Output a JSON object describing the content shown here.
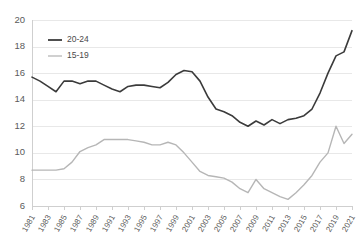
{
  "chart_data": {
    "type": "line",
    "title": "",
    "subtitle": "",
    "xlabel": "",
    "ylabel": "",
    "xlim": [
      1981,
      2021
    ],
    "ylim": [
      6,
      20
    ],
    "ytick_step": 2,
    "grid": true,
    "legend_position": "top-left",
    "ytick_labels": [
      "20",
      "18",
      "16",
      "14",
      "12",
      "10",
      "8",
      "6"
    ],
    "ytick_values": [
      20,
      18,
      16,
      14,
      12,
      10,
      8,
      6
    ],
    "xtick_labels": [
      "1981",
      "1983",
      "1985",
      "1987",
      "1989",
      "1991",
      "1993",
      "1995",
      "1997",
      "1999",
      "2001",
      "2003",
      "2005",
      "2007",
      "2009",
      "2011",
      "2013",
      "2015",
      "2017",
      "2019",
      "2021"
    ],
    "xtick_values": [
      1981,
      1983,
      1985,
      1987,
      1989,
      1991,
      1993,
      1995,
      1997,
      1999,
      2001,
      2003,
      2005,
      2007,
      2009,
      2011,
      2013,
      2015,
      2017,
      2019,
      2021
    ],
    "x": [
      1981,
      1982,
      1983,
      1984,
      1985,
      1986,
      1987,
      1988,
      1989,
      1990,
      1991,
      1992,
      1993,
      1994,
      1995,
      1996,
      1997,
      1998,
      1999,
      2000,
      2001,
      2002,
      2003,
      2004,
      2005,
      2006,
      2007,
      2008,
      2009,
      2010,
      2011,
      2012,
      2013,
      2014,
      2015,
      2016,
      2017,
      2018,
      2019,
      2020,
      2021
    ],
    "series": [
      {
        "name": "20-24",
        "color": "#3b3b3b",
        "width": 1.6,
        "values": [
          15.7,
          15.4,
          15.0,
          14.6,
          15.4,
          15.4,
          15.2,
          15.4,
          15.4,
          15.1,
          14.8,
          14.6,
          15.0,
          15.1,
          15.1,
          15.0,
          14.9,
          15.3,
          15.9,
          16.2,
          16.1,
          15.4,
          14.2,
          13.3,
          13.1,
          12.8,
          12.3,
          12.0,
          12.4,
          12.1,
          12.5,
          12.2,
          12.5,
          12.6,
          12.8,
          13.3,
          14.5,
          16.0,
          17.3,
          17.6,
          19.2
        ]
      },
      {
        "name": "15-19",
        "color": "#b6b6b6",
        "width": 1.4,
        "values": [
          8.7,
          8.7,
          8.7,
          8.7,
          8.8,
          9.3,
          10.1,
          10.4,
          10.6,
          11.0,
          11.0,
          11.0,
          11.0,
          10.9,
          10.8,
          10.6,
          10.6,
          10.8,
          10.6,
          10.0,
          9.3,
          8.6,
          8.3,
          8.2,
          8.1,
          7.8,
          7.3,
          7.0,
          8.0,
          7.3,
          7.0,
          6.7,
          6.5,
          7.0,
          7.6,
          8.3,
          9.3,
          10.0,
          12.0,
          10.7,
          11.4
        ]
      }
    ]
  },
  "legend": {
    "items": [
      {
        "label": "20-24",
        "color": "#3b3b3b"
      },
      {
        "label": "15-19",
        "color": "#b6b6b6"
      }
    ]
  }
}
